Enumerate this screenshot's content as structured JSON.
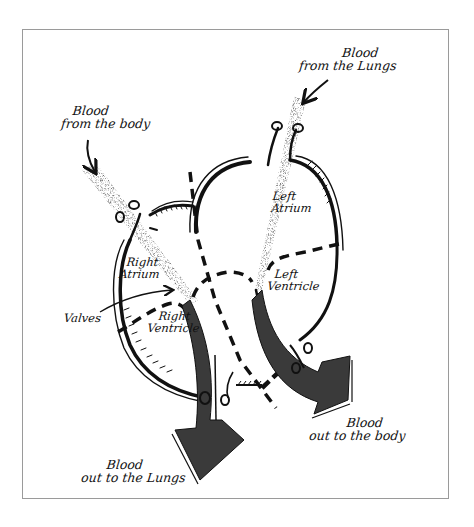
{
  "diagram": {
    "colors": {
      "ink": "#111111",
      "arrow_fill": "#3a3a3a",
      "stipple": "#555555",
      "frame": "#9a9a9a",
      "background": "#ffffff"
    },
    "labels": {
      "blood_from_lungs": {
        "line1": "Blood",
        "line2": "from the Lungs"
      },
      "blood_from_body": {
        "line1": "Blood",
        "line2": "from the body"
      },
      "left_atrium": {
        "line1": "Left",
        "line2": "Atrium"
      },
      "left_ventricle": {
        "line1": "Left",
        "line2": "Ventricle"
      },
      "right_atrium": {
        "line1": "Right",
        "line2": "Atrium"
      },
      "right_ventricle": {
        "line1": "Right",
        "line2": "Ventricle"
      },
      "valves": "Valves",
      "blood_out_to_body": {
        "line1": "Blood",
        "line2": "out to the body"
      },
      "blood_out_to_lungs": {
        "line1": "Blood",
        "line2": "out to the Lungs"
      }
    },
    "chambers": [
      "Right Atrium",
      "Right Ventricle",
      "Left Atrium",
      "Left Ventricle"
    ],
    "flows": [
      {
        "from": "body",
        "to": "Right Atrium",
        "style": "stippled"
      },
      {
        "from": "Right Ventricle",
        "to": "lungs",
        "style": "solid-arrow"
      },
      {
        "from": "lungs",
        "to": "Left Atrium",
        "style": "stippled"
      },
      {
        "from": "Left Ventricle",
        "to": "body",
        "style": "solid-arrow"
      }
    ]
  }
}
